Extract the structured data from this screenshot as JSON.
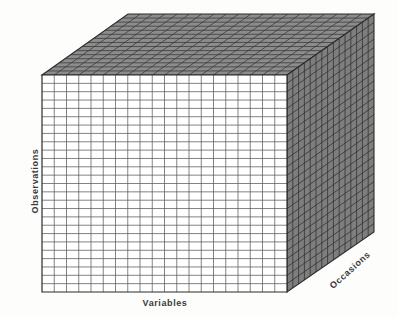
{
  "figure": {
    "kind": "3d-data-cube-diagram",
    "background_color": "#fdfdfc"
  },
  "axes": {
    "vertical": {
      "name": "observations-axis",
      "label": "Observations",
      "orientation": "vertical-rotated",
      "divisions": 26
    },
    "horizontal": {
      "name": "variables-axis",
      "label": "Variables",
      "orientation": "horizontal",
      "divisions": 20
    },
    "depth": {
      "name": "occasions-axis",
      "label": "Occasions",
      "orientation": "diagonal-depth",
      "divisions": 15
    }
  },
  "chart_data": {
    "type": "diagram",
    "title": "",
    "categories": [
      "Variables",
      "Observations",
      "Occasions"
    ],
    "values": [
      20,
      26,
      15
    ],
    "xlabel": "Variables",
    "ylabel": "Observations",
    "zlabel": "Occasions",
    "faces": [
      {
        "name": "front",
        "rows": 26,
        "cols": 20,
        "fill": "#ffffff",
        "stroke": "#5a5a5a"
      },
      {
        "name": "top",
        "rows": 15,
        "cols": 20,
        "fill": "#8c8c8c",
        "stroke": "#3c3c3c"
      },
      {
        "name": "right",
        "rows": 26,
        "cols": 15,
        "fill": "#7e7e7e",
        "stroke": "#343434"
      }
    ],
    "geometry": {
      "front_top_left": [
        42,
        75
      ],
      "front_top_right": [
        287,
        75
      ],
      "front_bottom_left": [
        42,
        292
      ],
      "front_bottom_right": [
        287,
        292
      ],
      "back_top_left": [
        128,
        14
      ],
      "back_top_right": [
        374,
        14
      ],
      "back_bottom_right": [
        374,
        232
      ]
    }
  },
  "colors": {
    "front_fill": "#ffffff",
    "front_line": "#5a5a5a",
    "top_fill": "#8c8c8c",
    "top_line": "#3c3c3c",
    "right_fill": "#7e7e7e",
    "right_line": "#343434",
    "outline": "#2b2b2b",
    "text": "#3a3a3a",
    "background": "#fdfdfc"
  }
}
